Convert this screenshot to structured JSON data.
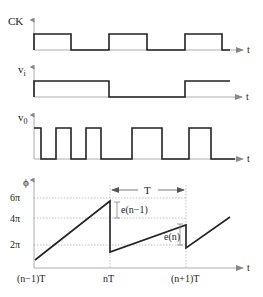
{
  "figure": {
    "colors": {
      "waveform": "#222222",
      "axis": "#999999",
      "grid": "#aaaaaa",
      "text": "#222222"
    }
  },
  "panels": {
    "ck": {
      "label": "CK",
      "time_label": "t",
      "transitions_x": [
        34,
        71,
        109,
        147,
        185,
        222,
        230
      ],
      "levels": [
        "high",
        "low",
        "high",
        "low",
        "high",
        "low"
      ]
    },
    "vi": {
      "label": "v",
      "label_sub": "i",
      "time_label": "t",
      "levels": [
        "high",
        "low",
        "high"
      ]
    },
    "vo": {
      "label": "v",
      "label_sub": "0",
      "time_label": "t",
      "levels": [
        "high",
        "low",
        "high",
        "low",
        "high",
        "low",
        "high",
        "low",
        "high",
        "low"
      ]
    },
    "phase": {
      "y_label": "ϕ",
      "y_ticks": [
        "6π",
        "4π",
        "2π"
      ],
      "time_label": "t",
      "x_ticks": [
        "(n−1)T",
        "nT",
        "(n+1)T"
      ],
      "period_label": "T",
      "error_labels": [
        "e(n−1)",
        "e(n)"
      ]
    }
  }
}
